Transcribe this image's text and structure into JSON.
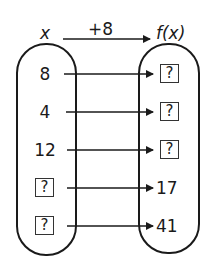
{
  "header": {
    "input_label": "x",
    "output_label": "f(x)",
    "operation": "+8"
  },
  "rows": [
    {
      "input": "8",
      "output": "?"
    },
    {
      "input": "4",
      "output": "?"
    },
    {
      "input": "12",
      "output": "?"
    },
    {
      "input": "?",
      "output": "17"
    },
    {
      "input": "?",
      "output": "41"
    }
  ],
  "colors": {
    "stroke": "#1a1a1a",
    "background": "#ffffff"
  }
}
